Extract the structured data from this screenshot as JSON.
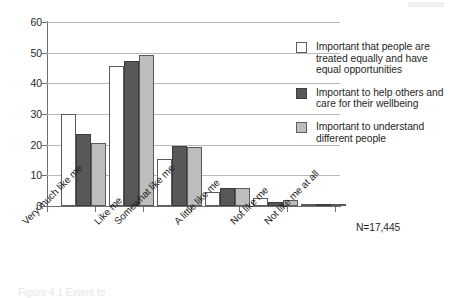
{
  "chart_data": {
    "type": "bar",
    "title": "",
    "subtitle": "",
    "xlabel": "",
    "ylabel": "",
    "ylim": [
      0,
      60
    ],
    "yticks": [
      0,
      10,
      20,
      30,
      40,
      50,
      60
    ],
    "ytick_labels": [
      "0",
      "10",
      "20",
      "30",
      "40",
      "50",
      "60"
    ],
    "grid": true,
    "grid_axis": "y",
    "legend_position": "right",
    "categories": [
      "Very much like me",
      "Like me",
      "Somewhat like me",
      "A little like me",
      "Not like me",
      "Not like me at all"
    ],
    "series": [
      {
        "name": "Important that people are treated equally and have equal opportunities",
        "color": "#ffffff",
        "values": [
          30.0,
          45.8,
          15.2,
          4.5,
          2.5,
          0.4
        ]
      },
      {
        "name": "Important to help others and care for their wellbeing",
        "color": "#58585a",
        "values": [
          23.6,
          47.4,
          19.5,
          5.8,
          1.2,
          0.4
        ]
      },
      {
        "name": "Important to understand different people",
        "color": "#bdbdbd",
        "values": [
          20.7,
          49.4,
          19.4,
          5.9,
          2.0,
          0.5
        ]
      }
    ],
    "annotations": [
      {
        "name": "sample-size",
        "text": "N=17,445"
      }
    ]
  },
  "legend": {
    "entries": [
      {
        "label": "Important that people are treated equally and have equal opportunities",
        "color": "#ffffff"
      },
      {
        "label": "Important to help others and care for their wellbeing",
        "color": "#58585a"
      },
      {
        "label": "Important to understand different people",
        "color": "#bdbdbd"
      }
    ]
  },
  "axes": {
    "y_tick_labels": [
      "60",
      "50",
      "40",
      "30",
      "20",
      "10",
      "0"
    ],
    "x_tick_labels": [
      "Very much like me",
      "Like me",
      "Somewhat like me",
      "A little like me",
      "Not like me",
      "Not like me at all"
    ]
  },
  "annotation": {
    "sample_size": "N=17,445"
  },
  "caption": {
    "cut_off_text": "Figure 4.1  Extent to"
  }
}
